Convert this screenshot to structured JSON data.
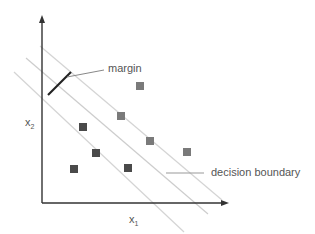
{
  "axes": {
    "x_label": "x",
    "x_sub": "1",
    "y_label": "x",
    "y_sub": "2"
  },
  "annotations": {
    "margin": "margin",
    "decision_boundary": "decision boundary"
  },
  "colors": {
    "axis": "#333333",
    "class_a": "#4a4a4a",
    "class_b": "#7a7a7a",
    "boundary_lines": "#cfcfcf",
    "margin_bar": "#222222",
    "leader": "#888888"
  },
  "points": {
    "class_a": [
      [
        83,
        127
      ],
      [
        96,
        153
      ],
      [
        74,
        169
      ],
      [
        128,
        168
      ]
    ],
    "class_b": [
      [
        140,
        86
      ],
      [
        121,
        116
      ],
      [
        150,
        141
      ],
      [
        187,
        152
      ]
    ]
  }
}
